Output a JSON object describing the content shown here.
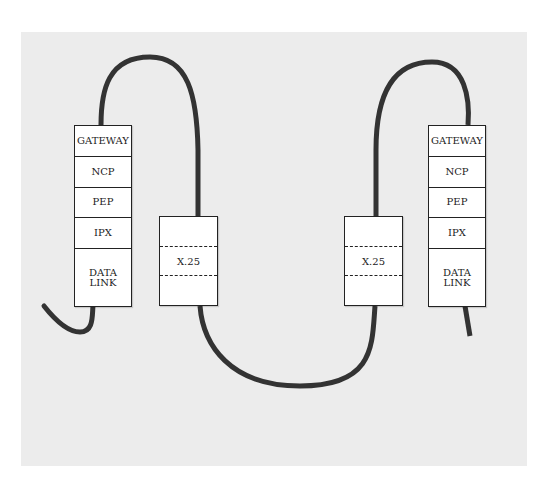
{
  "diagram": {
    "background_color": "#ececec",
    "cable_color": "#333333",
    "left_node": {
      "layers": [
        "GATEWAY",
        "NCP",
        "PEP",
        "IPX",
        "DATA LINK"
      ]
    },
    "left_x25": {
      "label": "X.25"
    },
    "right_x25": {
      "label": "X.25"
    },
    "right_node": {
      "layers": [
        "GATEWAY",
        "NCP",
        "PEP",
        "IPX",
        "DATA LINK"
      ]
    }
  }
}
